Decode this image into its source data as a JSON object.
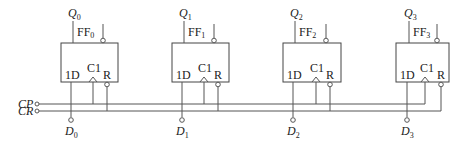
{
  "diagram": {
    "title": "",
    "type": "4-bit register with D flip-flops",
    "flip_flops": [
      {
        "name": "FF",
        "index": "0",
        "output": "Q",
        "input": "D",
        "pin_d": "1D",
        "pin_clk": "C1",
        "pin_reset": "R"
      },
      {
        "name": "FF",
        "index": "1",
        "output": "Q",
        "input": "D",
        "pin_d": "1D",
        "pin_clk": "C1",
        "pin_reset": "R"
      },
      {
        "name": "FF",
        "index": "2",
        "output": "Q",
        "input": "D",
        "pin_d": "1D",
        "pin_clk": "C1",
        "pin_reset": "R"
      },
      {
        "name": "FF",
        "index": "3",
        "output": "Q",
        "input": "D",
        "pin_d": "1D",
        "pin_clk": "C1",
        "pin_reset": "R"
      }
    ],
    "signals": {
      "clock": "CP",
      "clear": "CR"
    },
    "colors": {
      "line": "#555555",
      "text": "#222222",
      "background": "#ffffff"
    }
  }
}
